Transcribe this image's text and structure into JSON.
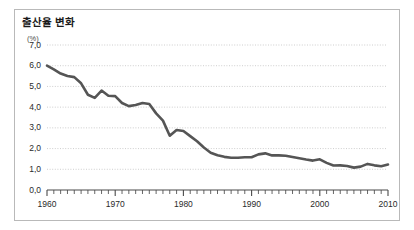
{
  "figure": {
    "title": "출산율 변화",
    "unit_label": "(%)",
    "background_color": "#ffffff",
    "border_color": "#b9b9b9",
    "line_color": "#555555",
    "gridline_color": "#c8c8c8",
    "axis_color": "#4a4a4a",
    "text_color": "#2a2a2a"
  },
  "chart_data": {
    "type": "line",
    "title": "출산율 변화",
    "xlabel": "",
    "ylabel": "(%)",
    "xlim": [
      1960,
      2010
    ],
    "ylim": [
      0.0,
      7.0
    ],
    "grid": true,
    "legend": false,
    "y_tick_labels": [
      "0,0",
      "1,0",
      "2,0",
      "3,0",
      "4,0",
      "5,0",
      "6,0",
      "7,0"
    ],
    "y_ticks": [
      0.0,
      1.0,
      2.0,
      3.0,
      4.0,
      5.0,
      6.0,
      7.0
    ],
    "x_tick_labels": [
      "1960",
      "1970",
      "1980",
      "1990",
      "2000",
      "2010"
    ],
    "x_ticks": [
      1960,
      1970,
      1980,
      1990,
      2000,
      2010
    ],
    "x_minor_tick_interval": 1,
    "series": [
      {
        "name": "출산율",
        "color": "#555555",
        "x": [
          1960,
          1961,
          1962,
          1963,
          1964,
          1965,
          1966,
          1967,
          1968,
          1969,
          1970,
          1971,
          1972,
          1973,
          1974,
          1975,
          1976,
          1977,
          1978,
          1979,
          1980,
          1981,
          1982,
          1983,
          1984,
          1985,
          1986,
          1987,
          1988,
          1989,
          1990,
          1991,
          1992,
          1993,
          1994,
          1995,
          1996,
          1997,
          1998,
          1999,
          2000,
          2001,
          2002,
          2003,
          2004,
          2005,
          2006,
          2007,
          2008,
          2009,
          2010
        ],
        "values": [
          6.0,
          5.82,
          5.62,
          5.5,
          5.45,
          5.15,
          4.6,
          4.45,
          4.8,
          4.55,
          4.53,
          4.2,
          4.05,
          4.1,
          4.2,
          4.15,
          3.7,
          3.35,
          2.62,
          2.9,
          2.85,
          2.6,
          2.35,
          2.05,
          1.8,
          1.68,
          1.6,
          1.56,
          1.56,
          1.58,
          1.58,
          1.72,
          1.77,
          1.67,
          1.67,
          1.65,
          1.59,
          1.53,
          1.47,
          1.42,
          1.48,
          1.31,
          1.18,
          1.19,
          1.16,
          1.08,
          1.13,
          1.26,
          1.19,
          1.15,
          1.23
        ]
      }
    ]
  }
}
